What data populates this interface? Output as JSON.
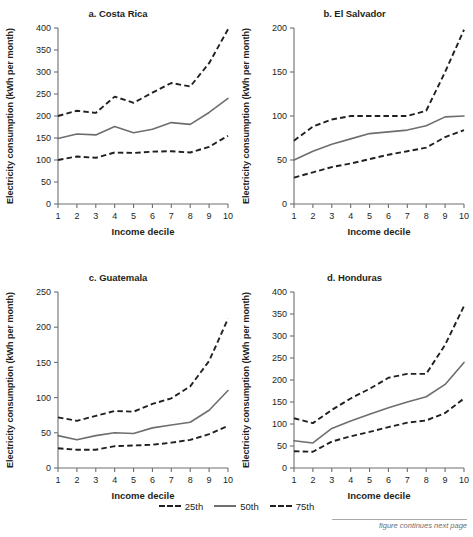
{
  "figure": {
    "footer_note": "figure continues next page",
    "axis_color": "#6d6e71",
    "dash_color": "#231f20",
    "solid_color": "#6d6e71"
  },
  "legend": {
    "items": [
      {
        "label": "25th",
        "style": "dashed"
      },
      {
        "label": "50th",
        "style": "solid"
      },
      {
        "label": "75th",
        "style": "dashed"
      }
    ]
  },
  "chart_data": [
    {
      "type": "line",
      "title": "a. Costa Rica",
      "xlabel": "Income decile",
      "ylabel": "Electricity consumption (kWh per month)",
      "x": [
        1,
        2,
        3,
        4,
        5,
        6,
        7,
        8,
        9,
        10
      ],
      "xticklabels": [
        "1",
        "2",
        "3",
        "4",
        "5",
        "6",
        "7",
        "8",
        "9",
        "10"
      ],
      "ylim": [
        0,
        400
      ],
      "yticks": [
        0,
        50,
        100,
        150,
        200,
        250,
        300,
        350,
        400
      ],
      "grid": false,
      "series": [
        {
          "name": "25th",
          "style": "dashed",
          "values": [
            100,
            108,
            105,
            117,
            116,
            119,
            120,
            117,
            130,
            155
          ]
        },
        {
          "name": "50th",
          "style": "solid",
          "values": [
            149,
            159,
            157,
            176,
            162,
            170,
            185,
            181,
            208,
            240
          ]
        },
        {
          "name": "75th",
          "style": "dashed",
          "values": [
            200,
            212,
            207,
            244,
            230,
            253,
            275,
            267,
            320,
            397
          ]
        }
      ]
    },
    {
      "type": "line",
      "title": "b. El Salvador",
      "xlabel": "Income decile",
      "ylabel": "Electricity consumption (kWh per month)",
      "x": [
        1,
        2,
        3,
        4,
        5,
        6,
        7,
        8,
        9,
        10
      ],
      "xticklabels": [
        "1",
        "2",
        "3",
        "4",
        "5",
        "6",
        "7",
        "8",
        "9",
        "10"
      ],
      "ylim": [
        0,
        200
      ],
      "yticks": [
        0,
        50,
        100,
        150,
        200
      ],
      "grid": false,
      "series": [
        {
          "name": "25th",
          "style": "dashed",
          "values": [
            30,
            36,
            42,
            46,
            51,
            56,
            60,
            64,
            76,
            84
          ]
        },
        {
          "name": "50th",
          "style": "solid",
          "values": [
            50,
            60,
            68,
            74,
            80,
            82,
            84,
            89,
            99,
            100
          ]
        },
        {
          "name": "75th",
          "style": "dashed",
          "values": [
            72,
            88,
            96,
            100,
            100,
            100,
            100,
            106,
            150,
            198
          ]
        }
      ]
    },
    {
      "type": "line",
      "title": "c. Guatemala",
      "xlabel": "Income decile",
      "ylabel": "Electricity consumption (kWh per month)",
      "x": [
        1,
        2,
        3,
        4,
        5,
        6,
        7,
        8,
        9,
        10
      ],
      "xticklabels": [
        "1",
        "2",
        "3",
        "4",
        "5",
        "6",
        "7",
        "8",
        "9",
        "10"
      ],
      "ylim": [
        0,
        250
      ],
      "yticks": [
        0,
        50,
        100,
        150,
        200,
        250
      ],
      "grid": false,
      "series": [
        {
          "name": "25th",
          "style": "dashed",
          "values": [
            28,
            26,
            26,
            31,
            32,
            33,
            36,
            40,
            48,
            60
          ]
        },
        {
          "name": "50th",
          "style": "solid",
          "values": [
            46,
            40,
            46,
            50,
            49,
            57,
            61,
            65,
            82,
            110
          ]
        },
        {
          "name": "75th",
          "style": "dashed",
          "values": [
            72,
            67,
            74,
            81,
            80,
            91,
            99,
            116,
            152,
            212
          ]
        }
      ]
    },
    {
      "type": "line",
      "title": "d. Honduras",
      "xlabel": "Income decile",
      "ylabel": "Electricity consumption (kWh per month)",
      "x": [
        1,
        2,
        3,
        4,
        5,
        6,
        7,
        8,
        9,
        10
      ],
      "xticklabels": [
        "1",
        "2",
        "3",
        "4",
        "5",
        "6",
        "7",
        "8",
        "9",
        "10"
      ],
      "ylim": [
        0,
        400
      ],
      "yticks": [
        0,
        50,
        100,
        150,
        200,
        250,
        300,
        350,
        400
      ],
      "grid": false,
      "series": [
        {
          "name": "25th",
          "style": "dashed",
          "values": [
            38,
            37,
            60,
            72,
            82,
            93,
            103,
            108,
            125,
            158
          ]
        },
        {
          "name": "50th",
          "style": "solid",
          "values": [
            62,
            57,
            90,
            107,
            122,
            137,
            150,
            162,
            190,
            240
          ]
        },
        {
          "name": "75th",
          "style": "dashed",
          "values": [
            113,
            102,
            132,
            158,
            180,
            205,
            214,
            214,
            280,
            368
          ]
        }
      ]
    }
  ]
}
